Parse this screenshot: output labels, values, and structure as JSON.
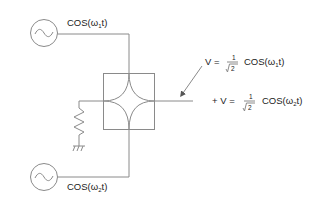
{
  "diagram": {
    "line_color": "#8a8a8a",
    "text_color": "#222222",
    "source_top": {
      "symbol": "ac-source",
      "label_prefix": "COS(ω",
      "label_sub": "1",
      "label_suffix": "t)"
    },
    "source_bottom": {
      "symbol": "ac-source",
      "label_prefix": "COS(ω",
      "label_sub": "2",
      "label_suffix": "t)"
    },
    "mixer": {
      "symbol": "four-port-hybrid"
    },
    "termination": {
      "symbol": "resistor-to-ground"
    },
    "output": {
      "line1": {
        "lhs": "V =",
        "frac_num": "1",
        "frac_den": "2",
        "func_prefix": "COS(ω",
        "func_sub": "1",
        "func_suffix": "t)"
      },
      "line2": {
        "lhs": "+ V =",
        "frac_num": "1",
        "frac_den": "2",
        "func_prefix": "COS(ω",
        "func_sub": "2",
        "func_suffix": "t)"
      }
    }
  }
}
